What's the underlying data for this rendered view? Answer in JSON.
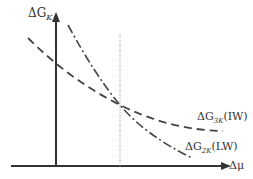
{
  "diagram": {
    "type": "line-diagram",
    "y_axis": {
      "label": "ΔG",
      "subscript": "K"
    },
    "x_axis": {
      "label": "Δμ"
    },
    "curves": [
      {
        "name": "ΔG3K(IW)",
        "label_main": "ΔG",
        "label_sub": "3K",
        "label_suffix": "(IW)",
        "style": "dashed"
      },
      {
        "name": "ΔG2K(LW)",
        "label_main": "ΔG",
        "label_sub": "2K",
        "label_suffix": "(LW)",
        "style": "dash-dot"
      }
    ],
    "reference_line": {
      "style": "dotted",
      "orientation": "vertical",
      "meaning": "crossover point"
    }
  },
  "colors": {
    "axis": "#333333",
    "curve": "#444444",
    "reference": "#888888"
  }
}
